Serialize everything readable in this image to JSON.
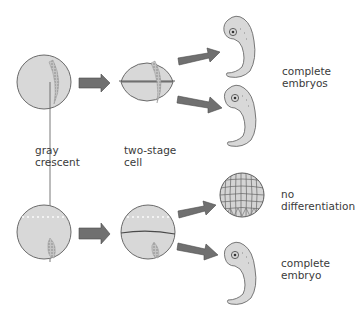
{
  "diagram": {
    "colors": {
      "cell_fill": "#d8d8d8",
      "cell_stroke": "#6a6a6a",
      "arrow_fill": "#707070",
      "arrow_stroke": "#4a4a4a",
      "crescent": "#9a9a9a",
      "text": "#3a3a3a"
    },
    "labels": {
      "gray_crescent": {
        "line1": "gray",
        "line2": "crescent"
      },
      "two_stage_cell": {
        "line1": "two-stage",
        "line2": "cell"
      },
      "complete_embryos": {
        "line1": "complete",
        "line2": "embryos"
      },
      "no_differentiation": {
        "line1": "no",
        "line2": "differentiation"
      },
      "complete_embryo": {
        "line1": "complete",
        "line2": "embryo"
      }
    },
    "rows": [
      {
        "name": "top-row",
        "description": "Fertilized egg split vertically through gray crescent",
        "outcomes": [
          "complete embryo",
          "complete embryo"
        ]
      },
      {
        "name": "bottom-row",
        "description": "Fertilized egg split horizontally; only one half has gray crescent",
        "outcomes": [
          "no differentiation",
          "complete embryo"
        ]
      }
    ]
  }
}
